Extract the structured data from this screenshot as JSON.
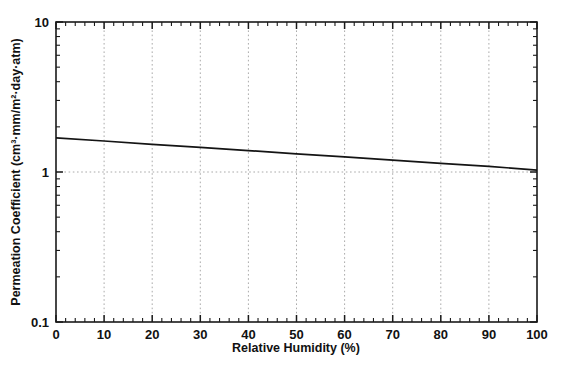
{
  "chart_data": {
    "type": "line",
    "title": "",
    "xlabel": "Relative Humidity (%)",
    "ylabel": "Permeation Coefficient (cm³·mm/m²·day·atm)",
    "xscale": "linear",
    "yscale": "log",
    "xlim": [
      0,
      100
    ],
    "ylim": [
      0.1,
      10
    ],
    "grid": true,
    "legend": false,
    "legend_position": "none",
    "xticks": [
      0,
      10,
      20,
      30,
      40,
      50,
      60,
      70,
      80,
      90,
      100
    ],
    "xticklabels": [
      "0",
      "10",
      "20",
      "30",
      "40",
      "50",
      "60",
      "70",
      "80",
      "90",
      "100"
    ],
    "x_minor_tick_step": 2,
    "yticks": [
      0.1,
      1,
      10
    ],
    "yticklabels": [
      "0.1",
      "1",
      "10"
    ],
    "series": [
      {
        "name": "permeation-coefficient",
        "color": "#141414",
        "x": [
          0,
          10,
          20,
          30,
          40,
          50,
          60,
          70,
          80,
          90,
          100
        ],
        "values": [
          1.69,
          1.61,
          1.53,
          1.46,
          1.39,
          1.32,
          1.26,
          1.2,
          1.14,
          1.09,
          1.03
        ]
      }
    ]
  },
  "axes": {
    "x_title": "Relative Humidity (%)",
    "y_title": "Permeation Coefficient (cm³·mm/m²·day·atm)",
    "y_top_label": "10",
    "y_mid_label": "1",
    "y_bottom_label": "0.1"
  },
  "style": {
    "background": "#ffffff",
    "frame_color": "#1a1a1a",
    "grid_color": "#aaaaaa",
    "line_color": "#141414"
  }
}
